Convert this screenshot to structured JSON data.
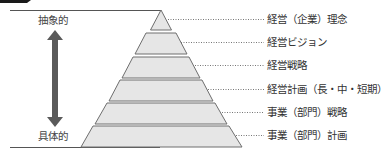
{
  "diagram": {
    "type": "pyramid",
    "axis": {
      "top_label": "抽象的",
      "bottom_label": "具体的",
      "arrow": "double-headed-vertical"
    },
    "levels": [
      {
        "label": "経営（企業）理念"
      },
      {
        "label": "経営ビジョン"
      },
      {
        "label": "経営戦略"
      },
      {
        "label": "経営計画（長・中・短期）"
      },
      {
        "label": "事業（部門）戦略"
      },
      {
        "label": "事業（部門）計画"
      }
    ],
    "colors": {
      "tier_fill": "#e6e6e6",
      "tier_stroke": "#6e6e6e",
      "arrow": "#5a5a5a",
      "text": "#333333",
      "tab": "#1a1a1a"
    }
  }
}
